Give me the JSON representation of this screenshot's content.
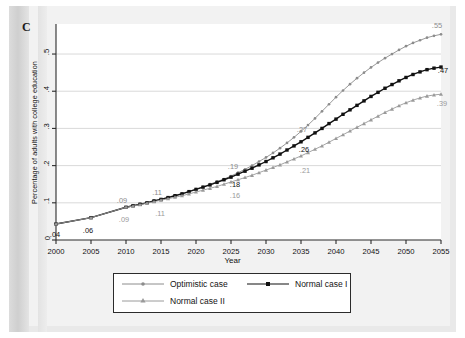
{
  "figure": {
    "panel_label": "C"
  },
  "chart_data": {
    "type": "line",
    "title": "",
    "xlabel": "Year",
    "ylabel": "Percentage of adults with college education",
    "xlim": [
      2000,
      2055
    ],
    "ylim": [
      0,
      0.57
    ],
    "xticks": [
      "2000",
      "2005",
      "2010",
      "2015",
      "2020",
      "2025",
      "2030",
      "2035",
      "2040",
      "2045",
      "2050",
      "2055"
    ],
    "yticks": [
      "0",
      ".1",
      ".2",
      ".3",
      ".4",
      ".5"
    ],
    "ytick_values": [
      0,
      0.1,
      0.2,
      0.3,
      0.4,
      0.5
    ],
    "grid": "horizontal",
    "legend_position": "bottom",
    "x": [
      2000,
      2005,
      2010,
      2011,
      2012,
      2013,
      2014,
      2015,
      2016,
      2017,
      2018,
      2019,
      2020,
      2021,
      2022,
      2023,
      2024,
      2025,
      2026,
      2027,
      2028,
      2029,
      2030,
      2031,
      2032,
      2033,
      2034,
      2035,
      2036,
      2037,
      2038,
      2039,
      2040,
      2041,
      2042,
      2043,
      2044,
      2045,
      2046,
      2047,
      2048,
      2049,
      2050,
      2051,
      2052,
      2053,
      2054,
      2055
    ],
    "series": [
      {
        "name": "Optimistic case",
        "color": "#8c8c8c",
        "marker": "dot",
        "values": [
          0.043,
          0.06,
          0.088,
          0.092,
          0.097,
          0.101,
          0.106,
          0.11,
          0.115,
          0.12,
          0.125,
          0.131,
          0.137,
          0.143,
          0.15,
          0.157,
          0.164,
          0.172,
          0.181,
          0.19,
          0.2,
          0.211,
          0.222,
          0.234,
          0.247,
          0.261,
          0.276,
          0.292,
          0.309,
          0.327,
          0.346,
          0.365,
          0.384,
          0.402,
          0.419,
          0.435,
          0.45,
          0.464,
          0.477,
          0.489,
          0.5,
          0.511,
          0.521,
          0.53,
          0.537,
          0.544,
          0.549,
          0.553
        ]
      },
      {
        "name": "Normal case I",
        "color": "#111111",
        "marker": "square",
        "values": [
          0.043,
          0.06,
          0.088,
          0.092,
          0.096,
          0.1,
          0.105,
          0.109,
          0.114,
          0.119,
          0.124,
          0.13,
          0.136,
          0.142,
          0.148,
          0.155,
          0.162,
          0.169,
          0.177,
          0.185,
          0.193,
          0.202,
          0.211,
          0.221,
          0.231,
          0.242,
          0.253,
          0.264,
          0.276,
          0.288,
          0.3,
          0.313,
          0.325,
          0.338,
          0.35,
          0.362,
          0.374,
          0.386,
          0.397,
          0.408,
          0.418,
          0.428,
          0.437,
          0.445,
          0.452,
          0.458,
          0.462,
          0.465
        ]
      },
      {
        "name": "Normal case II",
        "color": "#9a9a9a",
        "marker": "triangle",
        "values": [
          0.043,
          0.06,
          0.088,
          0.091,
          0.095,
          0.099,
          0.103,
          0.107,
          0.111,
          0.115,
          0.119,
          0.124,
          0.129,
          0.134,
          0.139,
          0.144,
          0.15,
          0.156,
          0.162,
          0.168,
          0.174,
          0.181,
          0.188,
          0.195,
          0.202,
          0.21,
          0.218,
          0.226,
          0.235,
          0.244,
          0.253,
          0.263,
          0.273,
          0.283,
          0.293,
          0.303,
          0.313,
          0.323,
          0.333,
          0.343,
          0.352,
          0.361,
          0.369,
          0.376,
          0.382,
          0.387,
          0.39,
          0.392
        ]
      }
    ],
    "annotations": [
      {
        "text": ".04",
        "x": 2000,
        "y": 0.043,
        "dx": -1,
        "dy": 13,
        "color": "#111111"
      },
      {
        "text": ".06",
        "x": 2005,
        "y": 0.06,
        "dx": -3,
        "dy": 15,
        "color": "#111111"
      },
      {
        "text": ".09",
        "x": 2010,
        "y": 0.088,
        "dx": -4,
        "dy": -4,
        "color": "#8c8c8c"
      },
      {
        "text": ".09",
        "x": 2010,
        "y": 0.088,
        "dx": -2,
        "dy": 15,
        "color": "#9a9a9a"
      },
      {
        "text": ".11",
        "x": 2015,
        "y": 0.11,
        "dx": -4,
        "dy": -4,
        "color": "#8c8c8c"
      },
      {
        "text": ".11",
        "x": 2015,
        "y": 0.107,
        "dx": -1,
        "dy": 16,
        "color": "#9a9a9a"
      },
      {
        "text": ".19",
        "x": 2026,
        "y": 0.181,
        "dx": -5,
        "dy": -4,
        "color": "#8c8c8c"
      },
      {
        "text": ".18",
        "x": 2026,
        "y": 0.177,
        "dx": -3,
        "dy": 13,
        "color": "#111111"
      },
      {
        "text": ".16",
        "x": 2026,
        "y": 0.162,
        "dx": -3,
        "dy": 18,
        "color": "#9a9a9a"
      },
      {
        "text": ".27",
        "x": 2036,
        "y": 0.292,
        "dx": -6,
        "dy": 1,
        "color": "#8c8c8c"
      },
      {
        "text": ".26",
        "x": 2036,
        "y": 0.264,
        "dx": -4,
        "dy": 10,
        "color": "#111111"
      },
      {
        "text": ".21",
        "x": 2036,
        "y": 0.226,
        "dx": -3,
        "dy": 17,
        "color": "#9a9a9a"
      },
      {
        "text": ".55",
        "x": 2055,
        "y": 0.553,
        "dx": -4,
        "dy": -6,
        "color": "#8c8c8c"
      },
      {
        "text": ".47",
        "x": 2055,
        "y": 0.465,
        "dx": 2,
        "dy": 6,
        "color": "#111111"
      },
      {
        "text": ".39",
        "x": 2055,
        "y": 0.392,
        "dx": 1,
        "dy": 12,
        "color": "#9a9a9a"
      }
    ]
  },
  "legend": {
    "items": [
      {
        "label": "Optimistic case",
        "color": "#8c8c8c",
        "marker": "dot"
      },
      {
        "label": "Normal case I",
        "color": "#111111",
        "marker": "square"
      },
      {
        "label": "Normal case II",
        "color": "#9a9a9a",
        "marker": "triangle"
      }
    ]
  }
}
